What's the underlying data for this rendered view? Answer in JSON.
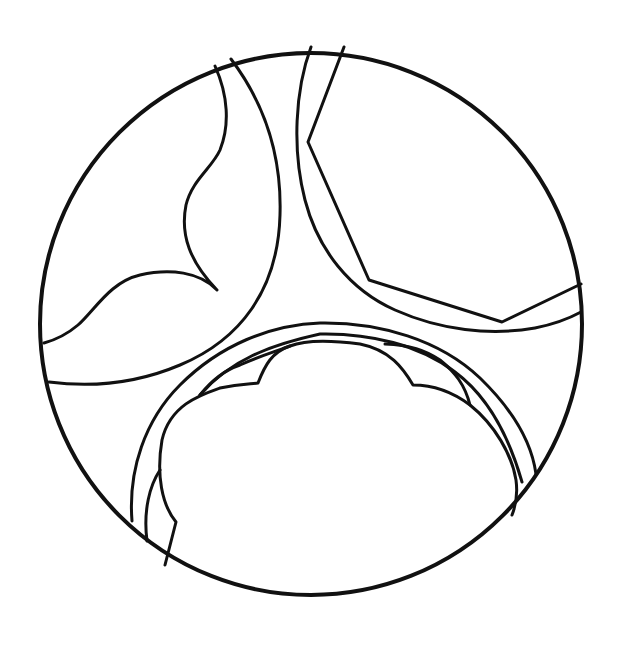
{
  "figure": {
    "title": "",
    "stroke_color": "#111111",
    "background_color": "#ffffff",
    "outer_circle": {
      "cx": 311,
      "cy": 324,
      "r": 271
    }
  }
}
